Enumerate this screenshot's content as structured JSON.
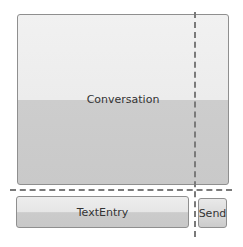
{
  "diagram": {
    "conversation": {
      "label": "Conversation"
    },
    "text_entry": {
      "label": "TextEntry"
    },
    "send_button": {
      "label": "Send"
    },
    "guides": {
      "horizontal": "dashed",
      "vertical": "dashed"
    },
    "colors": {
      "panel_light": "#eeeeee",
      "panel_dark": "#cbcbcb",
      "border": "#8f8f8f",
      "guide": "#7a7a7a"
    }
  }
}
